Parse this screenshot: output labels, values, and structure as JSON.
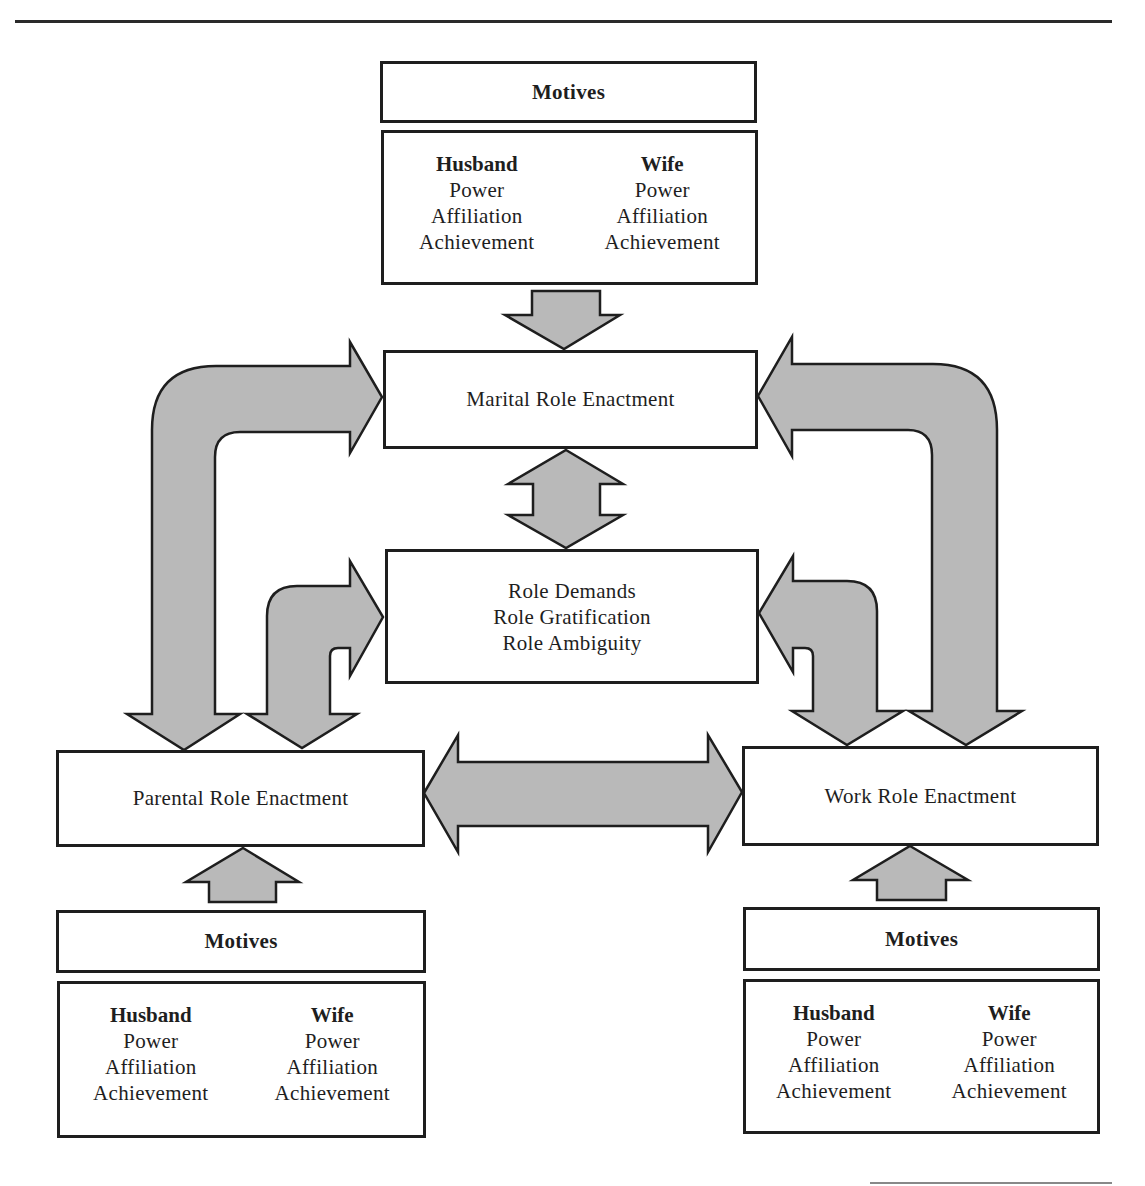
{
  "diagram": {
    "top_motives": {
      "header": "Motives",
      "husband": {
        "title": "Husband",
        "items": [
          "Power",
          "Affiliation",
          "Achievement"
        ]
      },
      "wife": {
        "title": "Wife",
        "items": [
          "Power",
          "Affiliation",
          "Achievement"
        ]
      }
    },
    "marital": {
      "label": "Marital Role Enactment"
    },
    "role_box": {
      "lines": [
        "Role Demands",
        "Role Gratification",
        "Role Ambiguity"
      ]
    },
    "parental": {
      "label": "Parental Role Enactment"
    },
    "work": {
      "label": "Work Role Enactment"
    },
    "left_motives": {
      "header": "Motives",
      "husband": {
        "title": "Husband",
        "items": [
          "Power",
          "Affiliation",
          "Achievement"
        ]
      },
      "wife": {
        "title": "Wife",
        "items": [
          "Power",
          "Affiliation",
          "Achievement"
        ]
      }
    },
    "right_motives": {
      "header": "Motives",
      "husband": {
        "title": "Husband",
        "items": [
          "Power",
          "Affiliation",
          "Achievement"
        ]
      },
      "wife": {
        "title": "Wife",
        "items": [
          "Power",
          "Affiliation",
          "Achievement"
        ]
      }
    },
    "colors": {
      "arrow_fill": "#b9b9b9",
      "stroke": "#1e1e1e"
    }
  }
}
